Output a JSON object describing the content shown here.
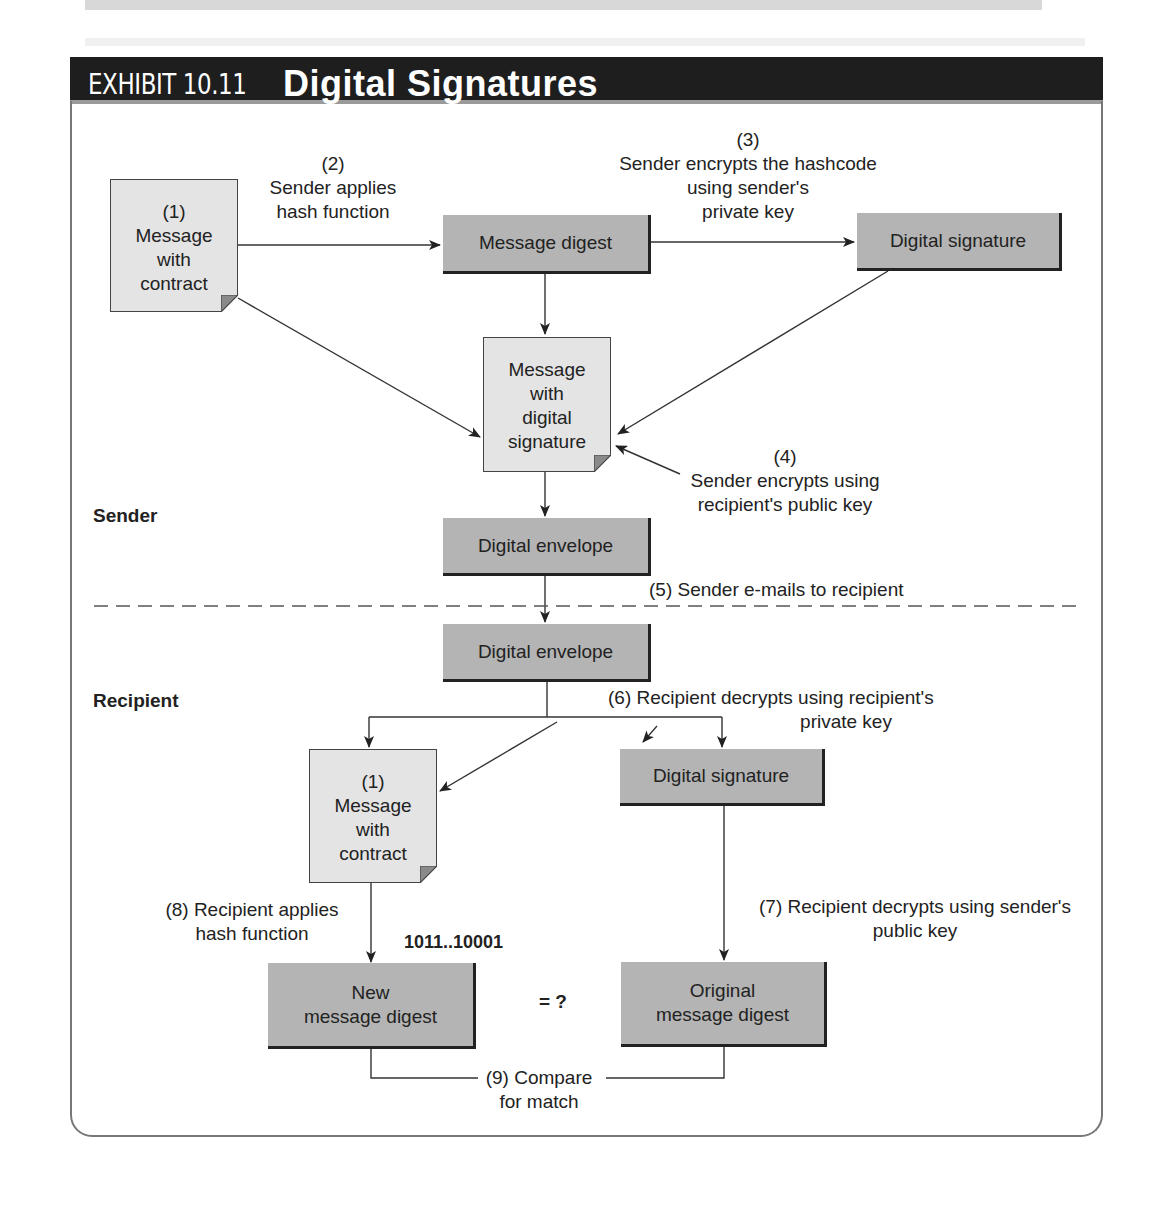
{
  "exhibit": {
    "label": "EXHIBIT 10.11",
    "title": "Digital Signatures"
  },
  "colors": {
    "header_bg": "#1e1e1e",
    "box_fill": "#b4b4b4",
    "document_fill": "#e4e4e4",
    "text": "#222222"
  },
  "sections": {
    "sender": "Sender",
    "recipient": "Recipient"
  },
  "sender": {
    "message_doc": [
      "(1)",
      "Message",
      "with",
      "contract"
    ],
    "step2": [
      "(2)",
      "Sender applies",
      "hash function"
    ],
    "message_digest": "Message digest",
    "step3": [
      "(3)",
      "Sender encrypts the hashcode",
      "using sender's",
      "private key"
    ],
    "digital_signature": "Digital signature",
    "signed_doc": [
      "Message",
      "with",
      "digital",
      "signature"
    ],
    "step4": [
      "(4)",
      "Sender encrypts using",
      "recipient's public key"
    ],
    "digital_envelope": "Digital envelope",
    "step5": "(5) Sender e-mails to recipient"
  },
  "recipient": {
    "digital_envelope": "Digital envelope",
    "step6": [
      "(6) Recipient decrypts using recipient's",
      "private key"
    ],
    "message_doc": [
      "(1)",
      "Message",
      "with",
      "contract"
    ],
    "digital_signature": "Digital signature",
    "step7": [
      "(7) Recipient decrypts using sender's",
      "public key"
    ],
    "step8": [
      "(8) Recipient applies",
      "hash function"
    ],
    "hash_value": "1011..10001",
    "new_digest": [
      "New",
      "message digest"
    ],
    "equals": "= ?",
    "original_digest": [
      "Original",
      "message digest"
    ],
    "step9": [
      "(9) Compare",
      "for match"
    ]
  }
}
